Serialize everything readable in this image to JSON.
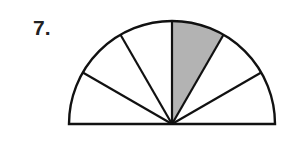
{
  "problem": {
    "number_label": "7."
  },
  "figure": {
    "type": "semicircle-fraction",
    "total_sectors": 6,
    "shaded_sectors": 1,
    "shaded_sector_index": 2,
    "colors": {
      "stroke": "#111111",
      "fill": "#ffffff",
      "shaded": "#b3b3b3"
    }
  }
}
